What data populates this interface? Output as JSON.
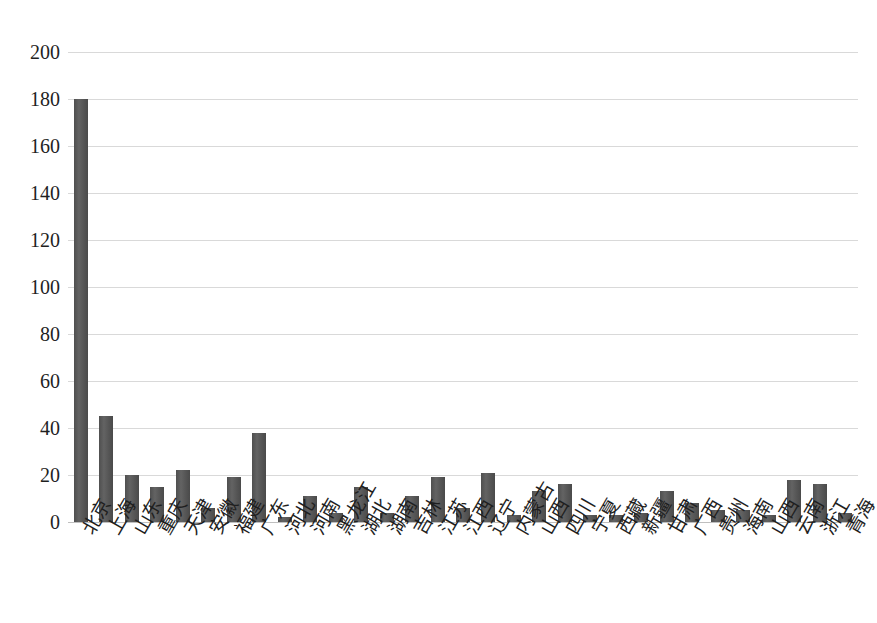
{
  "chart_data": {
    "type": "bar",
    "title": "",
    "subtitle": "",
    "xlabel": "",
    "ylabel": "",
    "ylim": [
      0,
      200
    ],
    "ytick_step": 20,
    "yticks": [
      "0",
      "20",
      "40",
      "60",
      "80",
      "100",
      "120",
      "140",
      "160",
      "180",
      "200"
    ],
    "grid": true,
    "legend": false,
    "legend_position": "none",
    "bar_color": "#595959",
    "gridline_color": "#d9d9d9",
    "axis_text_color": "#1f1f1f",
    "categories": [
      "北京",
      "上海",
      "山东",
      "重庆",
      "天津",
      "安徽",
      "福建",
      "广东",
      "河北",
      "河南",
      "黑龙江",
      "湖北",
      "湖南",
      "吉林",
      "江苏",
      "江西",
      "辽宁",
      "内蒙古",
      "山西",
      "四川",
      "宁夏",
      "西藏",
      "新疆",
      "甘肃",
      "广西",
      "贵州",
      "海南",
      "山西",
      "云南",
      "浙江",
      "青海"
    ],
    "values": [
      180,
      45,
      20,
      15,
      22,
      6,
      19,
      38,
      2,
      11,
      4,
      15,
      4,
      11,
      19,
      6,
      21,
      3,
      13,
      16,
      3,
      3,
      4,
      13,
      8,
      5,
      5,
      3,
      18,
      16,
      4
    ]
  }
}
